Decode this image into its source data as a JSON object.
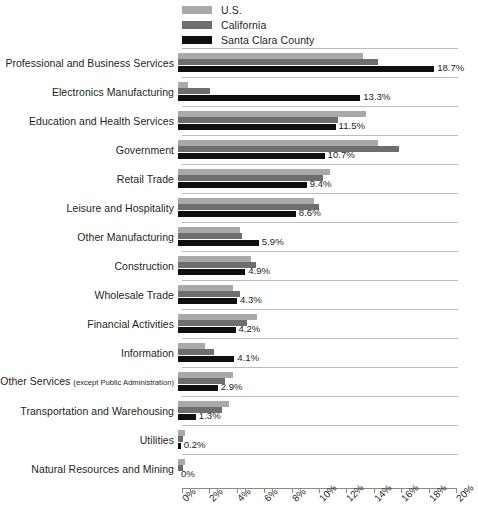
{
  "chart_data": {
    "type": "bar",
    "orientation": "horizontal",
    "title": "",
    "xlabel": "",
    "ylabel": "",
    "xlim": [
      0,
      20
    ],
    "xticks": [
      "0%",
      "2%",
      "4%",
      "6%",
      "8%",
      "10%",
      "12%",
      "14%",
      "16%",
      "18%",
      "20%"
    ],
    "xtick_values": [
      0,
      2,
      4,
      6,
      8,
      10,
      12,
      14,
      16,
      18,
      20
    ],
    "grid": true,
    "legend_position": "top-left",
    "legend": [
      "U.S.",
      "California",
      "Santa Clara County"
    ],
    "colors": {
      "us": "#a9a9a9",
      "california": "#6e6e6e",
      "santa_clara_county": "#0f0f0f",
      "gridline": "#bcbcbc",
      "axis": "#8a8a8a",
      "text": "#231f20"
    },
    "categories": [
      "Professional and Business Services",
      "Electronics Manufacturing",
      "Education and Health Services",
      "Government",
      "Retail Trade",
      "Leisure and Hospitality",
      "Other Manufacturing",
      "Construction",
      "Wholesale Trade",
      "Financial Activities",
      "Information",
      "Other Services (except Public Administration)",
      "Transportation and Warehousing",
      "Utilities",
      "Natural Resources and Mining"
    ],
    "series": [
      {
        "name": "U.S.",
        "values": [
          13.5,
          0.7,
          13.7,
          14.6,
          11.1,
          9.9,
          4.5,
          5.3,
          4.0,
          5.8,
          2.0,
          4.0,
          3.7,
          0.5,
          0.5
        ]
      },
      {
        "name": "California",
        "values": [
          14.6,
          2.3,
          11.7,
          16.1,
          10.6,
          10.3,
          4.7,
          5.7,
          4.5,
          5.0,
          2.6,
          3.4,
          3.2,
          0.4,
          0.4
        ]
      },
      {
        "name": "Santa Clara County",
        "values": [
          18.7,
          13.3,
          11.5,
          10.7,
          9.4,
          8.6,
          5.9,
          4.9,
          4.3,
          4.2,
          4.1,
          2.9,
          1.3,
          0.2,
          0.0
        ]
      }
    ],
    "data_labels": [
      "18.7%",
      "13.3%",
      "11.5%",
      "10.7%",
      "9.4%",
      "8.6%",
      "5.9%",
      "4.9%",
      "4.3%",
      "4.2%",
      "4.1%",
      "2.9%",
      "1.3%",
      "0.2%",
      "0%"
    ]
  },
  "rows": [
    {
      "label": "Professional and Business Services",
      "sub": "",
      "us": 13.5,
      "ca": 14.6,
      "scc": 18.7,
      "value_label": "18.7%"
    },
    {
      "label": "Electronics Manufacturing",
      "sub": "",
      "us": 0.7,
      "ca": 2.3,
      "scc": 13.3,
      "value_label": "13.3%"
    },
    {
      "label": "Education and Health Services",
      "sub": "",
      "us": 13.7,
      "ca": 11.7,
      "scc": 11.5,
      "value_label": "11.5%"
    },
    {
      "label": "Government",
      "sub": "",
      "us": 14.6,
      "ca": 16.1,
      "scc": 10.7,
      "value_label": "10.7%"
    },
    {
      "label": "Retail Trade",
      "sub": "",
      "us": 11.1,
      "ca": 10.6,
      "scc": 9.4,
      "value_label": "9.4%"
    },
    {
      "label": "Leisure and Hospitality",
      "sub": "",
      "us": 9.9,
      "ca": 10.3,
      "scc": 8.6,
      "value_label": "8.6%"
    },
    {
      "label": "Other Manufacturing",
      "sub": "",
      "us": 4.5,
      "ca": 4.7,
      "scc": 5.9,
      "value_label": "5.9%"
    },
    {
      "label": "Construction",
      "sub": "",
      "us": 5.3,
      "ca": 5.7,
      "scc": 4.9,
      "value_label": "4.9%"
    },
    {
      "label": "Wholesale Trade",
      "sub": "",
      "us": 4.0,
      "ca": 4.5,
      "scc": 4.3,
      "value_label": "4.3%"
    },
    {
      "label": "Financial Activities",
      "sub": "",
      "us": 5.8,
      "ca": 5.0,
      "scc": 4.2,
      "value_label": "4.2%"
    },
    {
      "label": "Information",
      "sub": "",
      "us": 2.0,
      "ca": 2.6,
      "scc": 4.1,
      "value_label": "4.1%"
    },
    {
      "label": "Other Services ",
      "sub": "(except Public Administration)",
      "us": 4.0,
      "ca": 3.4,
      "scc": 2.9,
      "value_label": "2.9%"
    },
    {
      "label": "Transportation and Warehousing",
      "sub": "",
      "us": 3.7,
      "ca": 3.2,
      "scc": 1.3,
      "value_label": "1.3%"
    },
    {
      "label": "Utilities",
      "sub": "",
      "us": 0.5,
      "ca": 0.4,
      "scc": 0.2,
      "value_label": "0.2%"
    },
    {
      "label": "Natural Resources and Mining",
      "sub": "",
      "us": 0.5,
      "ca": 0.4,
      "scc": 0.0,
      "value_label": "0%"
    }
  ],
  "legend": {
    "items": [
      {
        "label": "U.S.",
        "color": "#a9a9a9"
      },
      {
        "label": "California",
        "color": "#6e6e6e"
      },
      {
        "label": "Santa Clara County",
        "color": "#0f0f0f"
      }
    ]
  },
  "axis": {
    "ticks": [
      "0%",
      "2%",
      "4%",
      "6%",
      "8%",
      "10%",
      "12%",
      "14%",
      "16%",
      "18%",
      "20%"
    ]
  }
}
